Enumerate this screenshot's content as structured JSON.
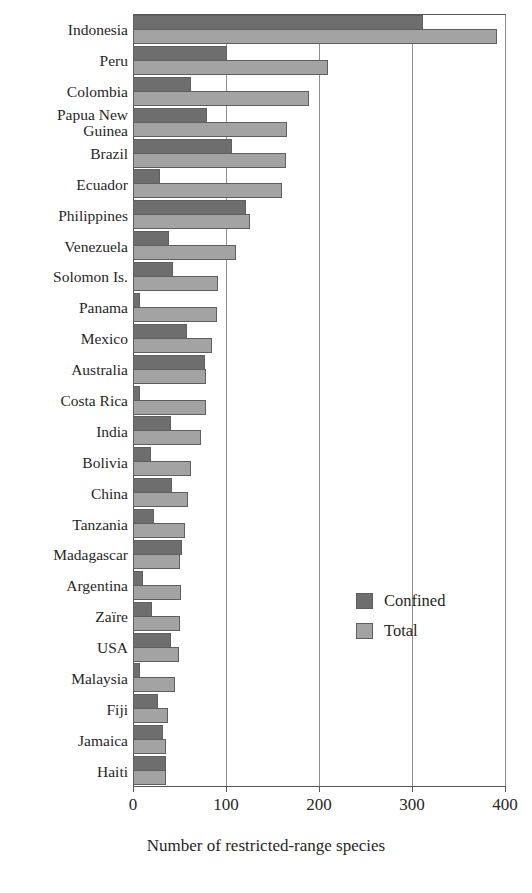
{
  "chart_data": {
    "type": "bar",
    "orientation": "horizontal",
    "title": "",
    "xlabel": "Number of restricted-range species",
    "ylabel": "",
    "xlim": [
      0,
      400
    ],
    "xticks": [
      0,
      100,
      200,
      300,
      400
    ],
    "grid": "vertical",
    "legend_position": "inside-right",
    "categories": [
      "Indonesia",
      "Peru",
      "Colombia",
      "Papua New\nGuinea",
      "Brazil",
      "Ecuador",
      "Philippines",
      "Venezuela",
      "Solomon Is.",
      "Panama",
      "Mexico",
      "Australia",
      "Costa Rica",
      "India",
      "Bolivia",
      "China",
      "Tanzania",
      "Madagascar",
      "Argentina",
      "Zaïre",
      "USA",
      "Malaysia",
      "Fiji",
      "Jamaica",
      "Haiti"
    ],
    "series": [
      {
        "name": "Confined",
        "color": "#6e6e6e",
        "values": [
          312,
          101,
          62,
          80,
          106,
          29,
          121,
          39,
          43,
          8,
          58,
          77,
          7,
          41,
          19,
          42,
          23,
          53,
          11,
          20,
          41,
          8,
          27,
          32,
          36
        ]
      },
      {
        "name": "Total",
        "color": "#a3a3a3",
        "values": [
          391,
          210,
          189,
          166,
          164,
          160,
          126,
          111,
          91,
          90,
          85,
          78,
          78,
          73,
          62,
          59,
          56,
          50,
          52,
          50,
          49,
          45,
          38,
          36,
          36
        ]
      }
    ]
  },
  "legend": {
    "items": [
      {
        "label": "Confined",
        "swatch": "confined"
      },
      {
        "label": "Total",
        "swatch": "total"
      }
    ]
  },
  "axis": {
    "x_title": "Number of restricted-range species",
    "x_tick_labels": [
      "0",
      "100",
      "200",
      "300",
      "400"
    ]
  }
}
